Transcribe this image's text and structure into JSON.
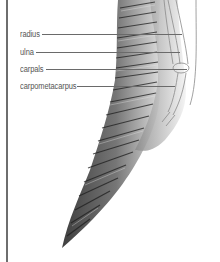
{
  "diagram": {
    "labels": [
      {
        "text": "radius",
        "y": 34,
        "x": 20,
        "line_start": 42,
        "line_end": 182
      },
      {
        "text": "ulna",
        "y": 52,
        "x": 20,
        "line_start": 36,
        "line_end": 180
      },
      {
        "text": "carpals",
        "y": 69,
        "x": 20,
        "line_start": 46,
        "line_end": 187
      },
      {
        "text": "carpometacarpus",
        "y": 86,
        "x": 20,
        "line_start": 77,
        "line_end": 175
      }
    ],
    "colors": {
      "frame": "#6e6e6e",
      "label_text": "#555555",
      "leader": "#6a6a6a",
      "feather_dark": "#3a3a3a",
      "feather_mid": "#7a7a7a",
      "bone_outline": "#8a8a8a"
    }
  }
}
